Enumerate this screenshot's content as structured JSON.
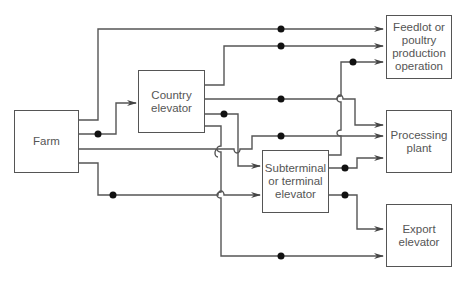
{
  "diagram": {
    "line_color": "#555555",
    "nodes": {
      "farm": {
        "label": "Farm"
      },
      "country_elevator": {
        "label": "Country elevator"
      },
      "subterminal": {
        "label": "Subterminal or terminal elevator"
      },
      "feedlot": {
        "label": "Feedlot or poultry production operation"
      },
      "processing": {
        "label": "Processing plant"
      },
      "export": {
        "label": "Export elevator"
      }
    },
    "edges": [
      {
        "from": "Farm",
        "to": "Feedlot or poultry production operation"
      },
      {
        "from": "Farm",
        "to": "Country elevator"
      },
      {
        "from": "Farm",
        "to": "Processing plant"
      },
      {
        "from": "Farm",
        "to": "Subterminal or terminal elevator"
      },
      {
        "from": "Farm",
        "to": "Export elevator"
      },
      {
        "from": "Country elevator",
        "to": "Feedlot or poultry production operation"
      },
      {
        "from": "Country elevator",
        "to": "Processing plant"
      },
      {
        "from": "Country elevator",
        "to": "Subterminal or terminal elevator"
      },
      {
        "from": "Country elevator",
        "to": "Export elevator"
      },
      {
        "from": "Subterminal or terminal elevator",
        "to": "Feedlot or poultry production operation"
      },
      {
        "from": "Subterminal or terminal elevator",
        "to": "Processing plant"
      },
      {
        "from": "Subterminal or terminal elevator",
        "to": "Export elevator"
      }
    ]
  }
}
